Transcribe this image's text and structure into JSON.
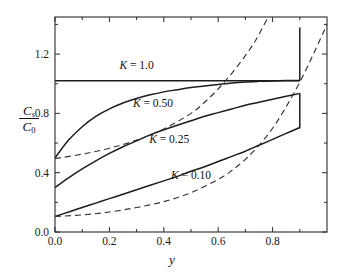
{
  "chart_data": {
    "type": "line",
    "title": "",
    "subtitle": "",
    "xlabel": "y",
    "ylabel": "Cs/C0",
    "ylabel_numerator": "C",
    "ylabel_numerator_sub": "s",
    "ylabel_denominator": "C",
    "ylabel_denominator_sub": "0",
    "xlim": [
      0.0,
      1.0
    ],
    "ylim": [
      0.0,
      1.45
    ],
    "grid": false,
    "legend_position": "inline-annotations",
    "xticks": [
      0.0,
      0.2,
      0.4,
      0.6,
      0.8
    ],
    "xticklabels": [
      "0.0",
      "0.2",
      "0.4",
      "0.6",
      "0.8"
    ],
    "xminorticks": [
      0.1,
      0.3,
      0.5,
      0.7,
      0.9
    ],
    "yticks": [
      0.0,
      0.4,
      0.8,
      1.2
    ],
    "yticklabels": [
      "0.0",
      "0.4",
      "0.8",
      "1.2"
    ],
    "yminorticks": [
      0.2,
      0.6,
      1.0,
      1.4
    ],
    "annotations": [
      {
        "text": "K = 1.0",
        "var": "K",
        "rest": " = 1.0",
        "x": 0.3,
        "y": 1.1
      },
      {
        "text": "K = 0.50",
        "var": "K",
        "rest": " = 0.50",
        "x": 0.36,
        "y": 0.84
      },
      {
        "text": "K = 0.25",
        "var": "K",
        "rest": " = 0.25",
        "x": 0.42,
        "y": 0.6
      },
      {
        "text": "K = 0.10",
        "var": "K",
        "rest": " = 0.10",
        "x": 0.5,
        "y": 0.36
      }
    ],
    "series": [
      {
        "name": "K = 1.0",
        "style": "solid",
        "points": [
          [
            0.0,
            1.02
          ],
          [
            0.9,
            1.02
          ]
        ]
      },
      {
        "name": "K = 0.50",
        "style": "solid",
        "points": [
          [
            0.0,
            0.5
          ],
          [
            0.05,
            0.62
          ],
          [
            0.1,
            0.71
          ],
          [
            0.15,
            0.78
          ],
          [
            0.2,
            0.83
          ],
          [
            0.25,
            0.87
          ],
          [
            0.3,
            0.9
          ],
          [
            0.35,
            0.925
          ],
          [
            0.4,
            0.945
          ],
          [
            0.45,
            0.96
          ],
          [
            0.5,
            0.975
          ],
          [
            0.55,
            0.985
          ],
          [
            0.6,
            0.995
          ],
          [
            0.65,
            1.005
          ],
          [
            0.7,
            1.012
          ],
          [
            0.75,
            1.016
          ],
          [
            0.8,
            1.019
          ],
          [
            0.85,
            1.021
          ],
          [
            0.9,
            1.022
          ]
        ]
      },
      {
        "name": "K = 0.25",
        "style": "solid",
        "points": [
          [
            0.0,
            0.3
          ],
          [
            0.05,
            0.365
          ],
          [
            0.1,
            0.425
          ],
          [
            0.15,
            0.48
          ],
          [
            0.2,
            0.53
          ],
          [
            0.25,
            0.575
          ],
          [
            0.3,
            0.615
          ],
          [
            0.35,
            0.655
          ],
          [
            0.4,
            0.69
          ],
          [
            0.45,
            0.72
          ],
          [
            0.5,
            0.75
          ],
          [
            0.55,
            0.78
          ],
          [
            0.6,
            0.805
          ],
          [
            0.65,
            0.83
          ],
          [
            0.7,
            0.855
          ],
          [
            0.75,
            0.875
          ],
          [
            0.8,
            0.895
          ],
          [
            0.85,
            0.915
          ],
          [
            0.9,
            0.935
          ]
        ]
      },
      {
        "name": "K = 0.10",
        "style": "solid",
        "points": [
          [
            0.0,
            0.105
          ],
          [
            0.05,
            0.135
          ],
          [
            0.1,
            0.165
          ],
          [
            0.15,
            0.195
          ],
          [
            0.2,
            0.225
          ],
          [
            0.25,
            0.255
          ],
          [
            0.3,
            0.285
          ],
          [
            0.35,
            0.315
          ],
          [
            0.4,
            0.345
          ],
          [
            0.45,
            0.375
          ],
          [
            0.5,
            0.41
          ],
          [
            0.55,
            0.44
          ],
          [
            0.6,
            0.475
          ],
          [
            0.65,
            0.51
          ],
          [
            0.7,
            0.545
          ],
          [
            0.75,
            0.585
          ],
          [
            0.8,
            0.625
          ],
          [
            0.85,
            0.665
          ],
          [
            0.9,
            0.705
          ]
        ]
      },
      {
        "name": "dashed-upper",
        "style": "dashed",
        "points": [
          [
            0.0,
            0.495
          ],
          [
            0.1,
            0.525
          ],
          [
            0.2,
            0.565
          ],
          [
            0.3,
            0.62
          ],
          [
            0.4,
            0.695
          ],
          [
            0.5,
            0.8
          ],
          [
            0.55,
            0.875
          ],
          [
            0.6,
            0.965
          ],
          [
            0.65,
            1.07
          ],
          [
            0.7,
            1.19
          ],
          [
            0.74,
            1.3
          ],
          [
            0.775,
            1.42
          ],
          [
            0.79,
            1.47
          ]
        ]
      },
      {
        "name": "dashed-lower",
        "style": "dashed",
        "points": [
          [
            0.0,
            0.105
          ],
          [
            0.1,
            0.115
          ],
          [
            0.2,
            0.135
          ],
          [
            0.3,
            0.165
          ],
          [
            0.4,
            0.205
          ],
          [
            0.5,
            0.265
          ],
          [
            0.6,
            0.355
          ],
          [
            0.65,
            0.415
          ],
          [
            0.7,
            0.49
          ],
          [
            0.75,
            0.585
          ],
          [
            0.8,
            0.7
          ],
          [
            0.85,
            0.845
          ],
          [
            0.9,
            1.01
          ],
          [
            0.95,
            1.2
          ],
          [
            1.0,
            1.4
          ]
        ]
      },
      {
        "name": "terminal-spike-K050",
        "style": "solid",
        "points": [
          [
            0.9,
            1.022
          ],
          [
            0.9,
            1.38
          ]
        ]
      },
      {
        "name": "terminal-drop-K025",
        "style": "solid",
        "points": [
          [
            0.9,
            0.935
          ],
          [
            0.9,
            0.7
          ]
        ]
      }
    ]
  }
}
